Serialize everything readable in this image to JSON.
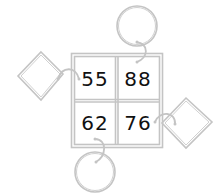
{
  "puzzle": {
    "cells": [
      {
        "position": "top-left",
        "value": "55"
      },
      {
        "position": "top-right",
        "value": "88"
      },
      {
        "position": "bottom-left",
        "value": "62"
      },
      {
        "position": "bottom-right",
        "value": "76"
      }
    ],
    "attachments": [
      {
        "shape": "circle",
        "side": "top",
        "attached_to": "88"
      },
      {
        "shape": "diamond",
        "side": "left",
        "attached_to": "55"
      },
      {
        "shape": "diamond",
        "side": "right",
        "attached_to": "76"
      },
      {
        "shape": "circle",
        "side": "bottom",
        "attached_to": "62"
      }
    ],
    "colors": {
      "line": "#c8c8c8",
      "text": "#111111",
      "background": "#ffffff"
    }
  }
}
